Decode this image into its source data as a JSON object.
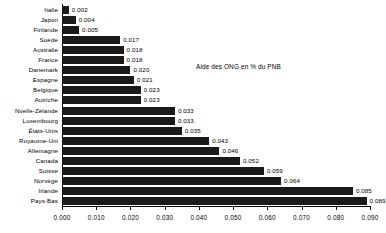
{
  "chart_data": {
    "type": "bar",
    "orientation": "horizontal",
    "title": "Aide des ONG en % du PNB",
    "xlabel": "",
    "ylabel": "",
    "xlim": [
      0.0,
      0.09
    ],
    "xticks": [
      "0.000",
      "0.010",
      "0.020",
      "0.030",
      "0.040",
      "0.050",
      "0.060",
      "0.070",
      "0.080",
      "0.090"
    ],
    "xtick_values": [
      0.0,
      0.01,
      0.02,
      0.03,
      0.04,
      0.05,
      0.06,
      0.07,
      0.08,
      0.09
    ],
    "grid": false,
    "legend": "none",
    "bar_color": "#1a1a1a",
    "categories": [
      "Italie",
      "Japon",
      "Finlande",
      "Suède",
      "Australie",
      "France",
      "Danemark",
      "Espagne",
      "Belgique",
      "Autriche",
      "Nvelle-Zélande",
      "Luxembourg",
      "États-Unis",
      "Royaume-Uni",
      "Allemagne",
      "Canada",
      "Suisse",
      "Norvège",
      "Irlande",
      "Pays-Bas"
    ],
    "values": [
      0.002,
      0.004,
      0.005,
      0.017,
      0.018,
      0.018,
      0.02,
      0.021,
      0.023,
      0.023,
      0.033,
      0.033,
      0.035,
      0.043,
      0.046,
      0.052,
      0.059,
      0.064,
      0.085,
      0.089
    ],
    "value_labels": [
      "0.002",
      "0.004",
      "0.005",
      "0.017",
      "0.018",
      "0.018",
      "0.020",
      "0.021",
      "0.023",
      "0.023",
      "0.033",
      "0.033",
      "0.035",
      "0.043",
      "0.046",
      "0.052",
      "0.059",
      "0.064",
      "0.085",
      "0.089"
    ]
  },
  "caption": ""
}
